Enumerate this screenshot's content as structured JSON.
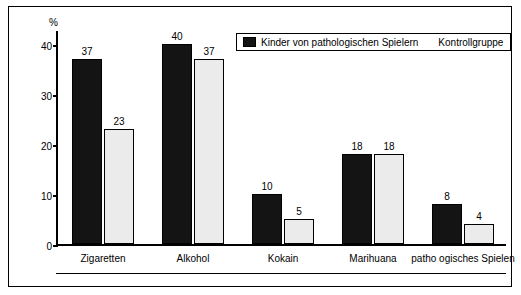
{
  "chart_data": {
    "type": "bar",
    "title": "",
    "subtitle": "",
    "xlabel": "",
    "ylabel": "%",
    "ylim": [
      0,
      43
    ],
    "yticks": [
      0,
      10,
      20,
      30,
      40
    ],
    "ytick_labels": [
      "0",
      "10",
      "20",
      "30",
      "40"
    ],
    "grid": false,
    "legend_position": "top-right",
    "categories": [
      "Zigaretten",
      "Alkohol",
      "Kokain",
      "Marihuana",
      "patho ogisches Spielen"
    ],
    "series": [
      {
        "name": "Kinder von pathologischen Spielern",
        "color": "#141414",
        "values": [
          37,
          40,
          10,
          18,
          8
        ],
        "value_labels": [
          "37",
          "40",
          "10",
          "18",
          "8"
        ]
      },
      {
        "name": "Kontrollgruppe",
        "color": "#ebebeb",
        "values": [
          23,
          37,
          5,
          18,
          4
        ],
        "value_labels": [
          "23",
          "37",
          "5",
          "18",
          "4"
        ]
      }
    ]
  },
  "legend": {
    "items": [
      {
        "label": "Kinder von pathologischen Spielern",
        "swatch": "dark"
      },
      {
        "label": "Kontrollgruppe",
        "swatch": "light"
      }
    ]
  }
}
